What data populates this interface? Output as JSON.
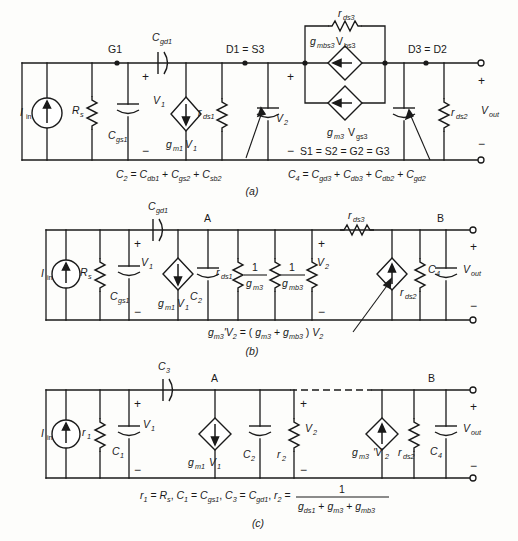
{
  "figure": {
    "subfigure_captions": [
      "(a)",
      "(b)",
      "(c)"
    ]
  },
  "circuit_a": {
    "caption": "(a)",
    "nodes": [
      {
        "name": "G1",
        "label": "G1"
      },
      {
        "name": "D1S3",
        "label": "D1 = S3"
      },
      {
        "name": "D3D2",
        "label": "D3 = D2"
      },
      {
        "name": "ground",
        "label": "S1 = S2 = G2 = G3"
      }
    ],
    "components": [
      {
        "name": "input-current-source",
        "type": "current-source",
        "base": "I",
        "sub": "in"
      },
      {
        "name": "source-resistance",
        "type": "resistor",
        "base": "R",
        "sub": "s"
      },
      {
        "name": "cgs1-capacitor",
        "type": "capacitor",
        "base": "C",
        "sub": "gs1"
      },
      {
        "name": "cgd1-capacitor",
        "type": "capacitor",
        "base": "C",
        "sub": "gd1"
      },
      {
        "name": "gm1v1-source",
        "type": "vccs",
        "base": "g",
        "sub": "m1",
        "base2": "V",
        "sub2": "1"
      },
      {
        "name": "rds1-resistor",
        "type": "resistor",
        "base": "r",
        "sub": "ds1"
      },
      {
        "name": "c2-capacitor",
        "type": "capacitor",
        "base": "C",
        "sub": "2"
      },
      {
        "name": "rds3-resistor",
        "type": "resistor",
        "base": "r",
        "sub": "ds3"
      },
      {
        "name": "gmbs3-source",
        "type": "vccs",
        "base": "g",
        "sub": "mbs3",
        "base2": "V",
        "sub2": "bs3"
      },
      {
        "name": "gm3vgs3-source",
        "type": "vccs",
        "base": "g",
        "sub": "m3",
        "base2": "V",
        "sub2": "gs3"
      },
      {
        "name": "c4-capacitor",
        "type": "capacitor",
        "base": "C",
        "sub": "4"
      },
      {
        "name": "rds2-resistor",
        "type": "resistor",
        "base": "r",
        "sub": "ds2"
      }
    ],
    "voltages": [
      {
        "name": "v1",
        "base": "V",
        "sub": "1"
      },
      {
        "name": "v2",
        "base": "V",
        "sub": "2"
      },
      {
        "name": "vout",
        "base": "V",
        "sub": "out"
      }
    ],
    "equations": [
      {
        "name": "c2-definition",
        "text": "C₂ = C₁ + C₂ + C₃",
        "parts": [
          "C",
          "2",
          " = ",
          "C",
          "db1",
          " + ",
          "C",
          "gs2",
          " + ",
          "C",
          "sb2"
        ]
      },
      {
        "name": "c4-definition",
        "parts": [
          "C",
          "4",
          " = ",
          "C",
          "gd3",
          " + ",
          "C",
          "db3",
          " + ",
          "C",
          "db2",
          " + ",
          "C",
          "gd2"
        ]
      }
    ]
  },
  "circuit_b": {
    "caption": "(b)",
    "nodes": [
      {
        "name": "node-a",
        "label": "A"
      },
      {
        "name": "node-b",
        "label": "B"
      }
    ],
    "components": [
      {
        "name": "input-current-source",
        "type": "current-source",
        "base": "I",
        "sub": "in"
      },
      {
        "name": "source-resistance",
        "type": "resistor",
        "base": "R",
        "sub": "s"
      },
      {
        "name": "cgs1-capacitor",
        "type": "capacitor",
        "base": "C",
        "sub": "gs1"
      },
      {
        "name": "cgd1-capacitor",
        "type": "capacitor",
        "base": "C",
        "sub": "gd1"
      },
      {
        "name": "gm1v1-source",
        "type": "vccs",
        "base": "g",
        "sub": "m1",
        "base2": "V",
        "sub2": "1"
      },
      {
        "name": "c2-capacitor",
        "type": "capacitor",
        "base": "C",
        "sub": "2"
      },
      {
        "name": "rds1-resistor",
        "type": "resistor",
        "base": "r",
        "sub": "ds1"
      },
      {
        "name": "one-over-gm3-resistor",
        "type": "resistor",
        "num": "1",
        "den_base": "g",
        "den_sub": "m3"
      },
      {
        "name": "one-over-gmb3-resistor",
        "type": "resistor",
        "num": "1",
        "den_base": "g",
        "den_sub": "mb3"
      },
      {
        "name": "rds3-resistor",
        "type": "resistor",
        "base": "r",
        "sub": "ds3"
      },
      {
        "name": "gm3prime-source",
        "type": "vccs"
      },
      {
        "name": "rds2-resistor",
        "type": "resistor",
        "base": "r",
        "sub": "ds2"
      },
      {
        "name": "c4-capacitor",
        "type": "capacitor",
        "base": "C",
        "sub": "4"
      }
    ],
    "voltages": [
      {
        "name": "v1",
        "base": "V",
        "sub": "1"
      },
      {
        "name": "v2",
        "base": "V",
        "sub": "2"
      },
      {
        "name": "vout",
        "base": "V",
        "sub": "out"
      }
    ],
    "equations": [
      {
        "name": "gm3-prime-definition",
        "parts": [
          "g",
          "m3",
          "'V",
          "2",
          " = ( ",
          "g",
          "m3",
          " + ",
          "g",
          "mb3",
          " ) ",
          "V",
          "2"
        ]
      }
    ]
  },
  "circuit_c": {
    "caption": "(c)",
    "nodes": [
      {
        "name": "node-a",
        "label": "A"
      },
      {
        "name": "node-b",
        "label": "B"
      }
    ],
    "components": [
      {
        "name": "input-current-source",
        "type": "current-source",
        "base": "I",
        "sub": "in"
      },
      {
        "name": "r1-resistor",
        "type": "resistor",
        "base": "r",
        "sub": "1"
      },
      {
        "name": "c1-capacitor",
        "type": "capacitor",
        "base": "C",
        "sub": "1"
      },
      {
        "name": "c3-capacitor",
        "type": "capacitor",
        "base": "C",
        "sub": "3"
      },
      {
        "name": "gm1v1-source",
        "type": "vccs",
        "base": "g",
        "sub": "m1",
        "base2": "V",
        "sub2": "1"
      },
      {
        "name": "c2-capacitor",
        "type": "capacitor",
        "base": "C",
        "sub": "2"
      },
      {
        "name": "r2-resistor",
        "type": "resistor",
        "base": "r",
        "sub": "2"
      },
      {
        "name": "gm3prime-source",
        "type": "vccs",
        "base": "g",
        "sub": "m3",
        "base2": "'V",
        "sub2": "2"
      },
      {
        "name": "rds2-resistor",
        "type": "resistor",
        "base": "r",
        "sub": "ds2"
      },
      {
        "name": "c4-capacitor",
        "type": "capacitor",
        "base": "C",
        "sub": "4"
      }
    ],
    "voltages": [
      {
        "name": "v1",
        "base": "V",
        "sub": "1"
      },
      {
        "name": "v2",
        "base": "V",
        "sub": "2"
      },
      {
        "name": "vout",
        "base": "V",
        "sub": "out"
      }
    ],
    "equations": [
      {
        "name": "element-definitions",
        "parts": [
          "r",
          "1",
          " = ",
          "R",
          "s",
          ",  ",
          "C",
          "1",
          " = ",
          "C",
          "gs1",
          ",  ",
          "C",
          "3",
          " = ",
          "C",
          "gd1",
          ",  ",
          "r",
          "2",
          " = "
        ]
      },
      {
        "name": "r2-fraction-numerator",
        "text": "1"
      },
      {
        "name": "r2-fraction-denominator",
        "parts": [
          "g",
          "ds1",
          " + ",
          "g",
          "m3",
          " + ",
          "g",
          "mb3"
        ]
      }
    ]
  },
  "symbols": {
    "plus": "+",
    "minus": "−",
    "equals": "="
  },
  "colors": {
    "ink": "#1a1a1a",
    "paper": "#fdfdfb"
  }
}
